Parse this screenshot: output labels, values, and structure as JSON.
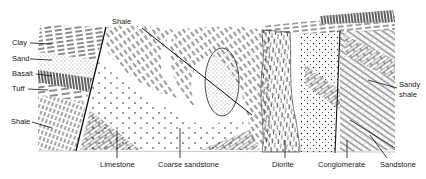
{
  "diagram": {
    "type": "geological cross-section",
    "colors": {
      "ink": "#1a1a1a",
      "paper": "#ffffff",
      "label": "#222222"
    },
    "labels": {
      "clay": "Clay",
      "sand": "Sand",
      "basalt": "Basalt",
      "tuff": "Tuff",
      "shale_left": "Shale",
      "shale_top": "Shale",
      "limestone": "Limestone",
      "coarse_sandstone": "Coarse sandstone",
      "diorite": "Diorite",
      "conglomerate": "Conglomerate",
      "sandstone": "Sandstone",
      "sandy_shale_line1": "Sandy",
      "sandy_shale_line2": "shale"
    }
  }
}
